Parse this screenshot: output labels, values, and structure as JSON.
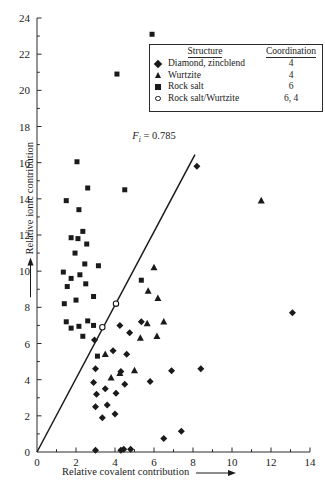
{
  "chart_data": {
    "type": "scatter",
    "title": "",
    "xlabel": "Relative covalent contribution",
    "ylabel": "Relative ionic contribution",
    "xlim": [
      0,
      14
    ],
    "ylim": [
      0,
      24
    ],
    "xticks": [
      0,
      2,
      4,
      6,
      8,
      10,
      12,
      14
    ],
    "yticks": [
      0,
      2,
      4,
      6,
      8,
      10,
      12,
      14,
      16,
      18,
      20,
      22,
      24
    ],
    "xtick_labels": [
      "0",
      "2",
      "4",
      "6",
      "8",
      "10",
      "12",
      "14"
    ],
    "ytick_labels": [
      "0",
      "2",
      "4",
      "6",
      "8",
      "10",
      "12",
      "14",
      "16",
      "18",
      "20",
      "22",
      "24"
    ],
    "minor_ticks": true,
    "grid": false,
    "legend_position": "top-right",
    "annotations": [
      {
        "name": "trend-line-label",
        "text": "F_i = 0.785",
        "text_main": "F",
        "text_sub": "i",
        "text_rest": " = 0.785",
        "x": 6.0,
        "y": 17.3
      }
    ],
    "trend_line": {
      "label": "F_i = 0.785",
      "slope": 2.03,
      "intercept": 0.0,
      "x_start": 0.0,
      "y_start": 0.0,
      "x_end": 8.1,
      "y_end": 16.45
    },
    "series": [
      {
        "name": "Diamond, zincblend",
        "marker": "diamond",
        "coordination": "4",
        "points": [
          [
            3.0,
            0.1
          ],
          [
            4.3,
            0.1
          ],
          [
            4.45,
            0.15
          ],
          [
            4.8,
            0.15
          ],
          [
            6.5,
            0.75
          ],
          [
            7.4,
            1.15
          ],
          [
            3.35,
            1.9
          ],
          [
            4.0,
            2.1
          ],
          [
            3.0,
            2.5
          ],
          [
            3.6,
            2.6
          ],
          [
            3.05,
            3.2
          ],
          [
            4.05,
            3.25
          ],
          [
            3.5,
            3.5
          ],
          [
            2.9,
            3.85
          ],
          [
            4.5,
            3.75
          ],
          [
            5.8,
            3.9
          ],
          [
            6.9,
            4.5
          ],
          [
            8.4,
            4.6
          ],
          [
            4.3,
            4.45
          ],
          [
            3.0,
            4.6
          ],
          [
            4.6,
            5.4
          ],
          [
            3.9,
            5.6
          ],
          [
            2.95,
            6.2
          ],
          [
            4.75,
            6.6
          ],
          [
            4.25,
            7.0
          ],
          [
            5.35,
            7.2
          ],
          [
            13.1,
            7.7
          ],
          [
            8.2,
            15.8
          ]
        ]
      },
      {
        "name": "Wurtzite",
        "marker": "triangle",
        "coordination": "4",
        "points": [
          [
            3.8,
            4.1
          ],
          [
            4.25,
            4.35
          ],
          [
            5.0,
            4.5
          ],
          [
            3.5,
            5.4
          ],
          [
            5.3,
            6.3
          ],
          [
            6.15,
            6.4
          ],
          [
            5.65,
            7.1
          ],
          [
            6.5,
            7.2
          ],
          [
            6.2,
            8.5
          ],
          [
            5.7,
            8.9
          ],
          [
            6.0,
            10.2
          ],
          [
            11.5,
            13.9
          ]
        ]
      },
      {
        "name": "Rock salt",
        "marker": "square",
        "coordination": "6",
        "points": [
          [
            3.1,
            5.3
          ],
          [
            2.35,
            6.4
          ],
          [
            1.75,
            6.85
          ],
          [
            2.15,
            6.95
          ],
          [
            2.9,
            7.0
          ],
          [
            1.5,
            7.2
          ],
          [
            2.6,
            7.25
          ],
          [
            1.4,
            8.2
          ],
          [
            2.0,
            8.4
          ],
          [
            2.9,
            8.6
          ],
          [
            1.55,
            9.15
          ],
          [
            2.5,
            9.3
          ],
          [
            1.75,
            9.6
          ],
          [
            2.2,
            9.8
          ],
          [
            1.35,
            9.95
          ],
          [
            2.45,
            10.4
          ],
          [
            3.15,
            10.3
          ],
          [
            1.95,
            11.0
          ],
          [
            2.55,
            11.5
          ],
          [
            2.1,
            11.8
          ],
          [
            1.75,
            11.85
          ],
          [
            2.35,
            12.2
          ],
          [
            2.15,
            13.4
          ],
          [
            1.5,
            13.9
          ],
          [
            2.6,
            14.6
          ],
          [
            4.5,
            14.5
          ],
          [
            2.05,
            16.05
          ],
          [
            5.35,
            9.5
          ],
          [
            4.1,
            20.9
          ],
          [
            5.9,
            23.1
          ]
        ]
      },
      {
        "name": "Rock salt/Wurtzite",
        "marker": "circle",
        "coordination": "6, 4",
        "points": [
          [
            3.35,
            6.9
          ],
          [
            4.05,
            8.2
          ]
        ]
      }
    ]
  },
  "legend": {
    "header_structure": "Structure",
    "header_coordination": "Coordination",
    "rows": [
      {
        "marker": "diamond",
        "label": "Diamond, zincblend",
        "coordination": "4"
      },
      {
        "marker": "triangle",
        "label": "Wurtzite",
        "coordination": "4"
      },
      {
        "marker": "square",
        "label": "Rock salt",
        "coordination": "6"
      },
      {
        "marker": "circle",
        "label": "Rock salt/Wurtzite",
        "coordination": "6, 4"
      }
    ]
  },
  "axes": {
    "x_title": "Relative covalent contribution",
    "y_title": "Relative ionic contribution"
  },
  "colors": {
    "marker": "#1a1a1a",
    "axis": "#2a2a2a",
    "background": "#ffffff"
  }
}
